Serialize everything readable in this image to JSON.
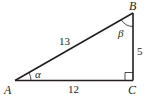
{
  "diagram": {
    "type": "right-triangle",
    "vertices": {
      "A": {
        "label": "A"
      },
      "B": {
        "label": "B"
      },
      "C": {
        "label": "C"
      }
    },
    "sides": {
      "AB": "13",
      "BC": "5",
      "AC": "12"
    },
    "angles": {
      "A": "α",
      "B": "β",
      "C": "right-angle"
    },
    "colors": {
      "stroke": "#231f20",
      "background": "#ffffff"
    }
  }
}
